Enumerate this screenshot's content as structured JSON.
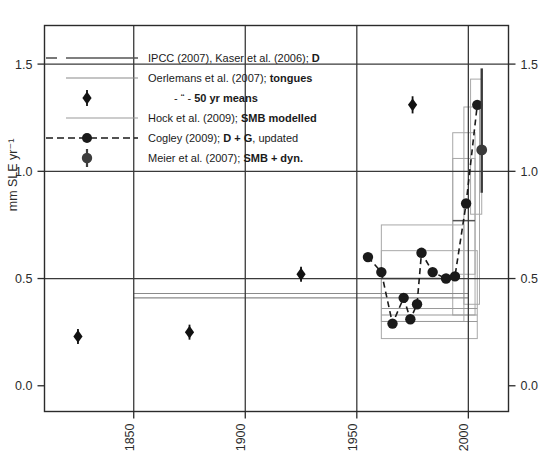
{
  "chart_data": {
    "type": "scatter",
    "title": "",
    "xlabel": "",
    "ylabel": "mm SLE yr⁻¹",
    "xlim": [
      1810,
      2018
    ],
    "ylim": [
      -0.12,
      1.68
    ],
    "xticks": [
      1850,
      1900,
      1950,
      2000
    ],
    "xticklabels": [
      "1850",
      "1900",
      "1950",
      "2000"
    ],
    "yticks": [
      0.0,
      0.5,
      1.0,
      1.5
    ],
    "yticklabels": [
      "0.0",
      "0.5",
      "1.0",
      "1.5"
    ],
    "ytick_labels_right": [
      "0.0",
      "0.5",
      "1.0",
      "1.5"
    ],
    "grid": true,
    "grid_note": "black gridlines at y=0.5,1.0,1.5 and x=1850,1900,1950,2000",
    "legend_position": "upper-left inside axes",
    "series": [
      {
        "name": "IPCC (2007), Kaser et al. (2006); D",
        "label_plain": "IPCC (2007), Kaser et al. (2006);",
        "label_bold": "D",
        "style": "horizontal-line",
        "color": "#555555",
        "segments": [
          {
            "x0": 1961,
            "x1": 1990,
            "y": 0.5
          },
          {
            "x0": 1993,
            "x1": 2003,
            "y": 0.77
          }
        ]
      },
      {
        "name": "Oerlemans et al. (2007); tongues",
        "label_plain": "Oerlemans et al. (2007);",
        "label_bold": "tongues",
        "style": "horizontal-line",
        "color": "#8a8a8a",
        "segments": [
          {
            "x0": 1850,
            "x1": 2000,
            "y": 0.43
          },
          {
            "x0": 1850,
            "x1": 2000,
            "y": 0.41
          }
        ]
      },
      {
        "name": "Oerlemans et al. (2007); 50 yr means",
        "label_plain": "- “ -",
        "label_bold": "50 yr means",
        "style": "diamond-marker-with-errorbar",
        "color": "#111111",
        "points": [
          {
            "x": 1825,
            "y": 0.23,
            "yerr": 0.035
          },
          {
            "x": 1875,
            "y": 0.25,
            "yerr": 0.035
          },
          {
            "x": 1925,
            "y": 0.52,
            "yerr": 0.035
          },
          {
            "x": 1975,
            "y": 1.31,
            "yerr": 0.04
          }
        ]
      },
      {
        "name": "Hock et al. (2009); SMB modelled",
        "label_plain": "Hock et al. (2009);",
        "label_bold": "SMB modelled",
        "style": "horizontal-line",
        "color": "#9a9a9a",
        "segments": [
          {
            "x0": 1961,
            "x1": 2004,
            "y": 0.36
          },
          {
            "x0": 1961,
            "x1": 2004,
            "y": 0.33
          },
          {
            "x0": 1961,
            "x1": 2004,
            "y": 0.3
          }
        ]
      },
      {
        "name": "Cogley (2009); D + G, updated",
        "label_plain_a": "Cogley (2009);",
        "label_bold": "D + G",
        "label_plain_b": ", updated",
        "style": "dashed-line-with-circle-markers",
        "color": "#1a1a1a",
        "points": [
          {
            "x": 1955,
            "y": 0.6
          },
          {
            "x": 1961,
            "y": 0.53
          },
          {
            "x": 1966,
            "y": 0.29
          },
          {
            "x": 1971,
            "y": 0.41
          },
          {
            "x": 1974,
            "y": 0.31
          },
          {
            "x": 1977,
            "y": 0.38
          },
          {
            "x": 1979,
            "y": 0.62
          },
          {
            "x": 1984,
            "y": 0.53
          },
          {
            "x": 1990,
            "y": 0.5
          },
          {
            "x": 1994,
            "y": 0.51
          },
          {
            "x": 1999,
            "y": 0.85
          },
          {
            "x": 2004,
            "y": 1.31
          }
        ]
      },
      {
        "name": "Meier et al. (2007); SMB + dyn.",
        "label_plain": "Meier et al.  (2007);",
        "label_bold": "SMB + dyn.",
        "style": "circle-marker-with-errorbar",
        "color": "#3a3a3a",
        "points": [
          {
            "x": 2006,
            "y": 1.1,
            "yerr_low": 0.2,
            "yerr_high": 0.38
          }
        ]
      }
    ],
    "uncertainty_boxes": [
      {
        "x0": 1961,
        "x1": 2004,
        "y0": 0.22,
        "y1": 0.63
      },
      {
        "x0": 1961,
        "x1": 1998,
        "y0": 0.3,
        "y1": 0.75
      },
      {
        "x0": 1993,
        "x1": 2003,
        "y0": 0.33,
        "y1": 1.18
      },
      {
        "x0": 1993,
        "x1": 2003,
        "y0": 0.52,
        "y1": 1.06
      },
      {
        "x0": 1998,
        "x1": 2005,
        "y0": 0.38,
        "y1": 1.3
      },
      {
        "x0": 2001,
        "x1": 2006,
        "y0": 0.8,
        "y1": 1.43
      }
    ]
  },
  "legend": {
    "entries": [
      {
        "plain": "IPCC (2007), Kaser et al. (2006); ",
        "bold": "D",
        "tail": ""
      },
      {
        "plain": "Oerlemans et al. (2007); ",
        "bold": "tongues",
        "tail": ""
      },
      {
        "plain": "- “ -",
        "bold": "50 yr means",
        "tail": ""
      },
      {
        "plain": "Hock et al. (2009); ",
        "bold": "SMB modelled",
        "tail": ""
      },
      {
        "plain": "Cogley (2009); ",
        "bold": "D + G",
        "tail": ", updated"
      },
      {
        "plain": "Meier et al.  (2007); ",
        "bold": "SMB + dyn.",
        "tail": ""
      }
    ]
  },
  "axes": {
    "y_title": "mm SLE yr⁻¹",
    "y_left": [
      "1.5",
      "1.0",
      "0.5",
      "0.0"
    ],
    "y_right": [
      "1.5",
      "1.0",
      "0.5",
      "0.0"
    ],
    "x_ticks": [
      "1850",
      "1900",
      "1950",
      "2000"
    ]
  },
  "colors": {
    "axis": "#2b2b2b",
    "grid": "#3a3a3a",
    "gray_line": "#9a9a9a",
    "box": "#a8a8a8",
    "marker": "#141414",
    "meier": "#3d3d3d"
  }
}
